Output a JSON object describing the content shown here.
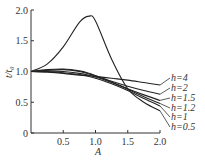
{
  "chart_data": {
    "type": "line",
    "title": "",
    "xlabel": "A",
    "ylabel": "t/t0",
    "xlim": [
      0,
      2.0
    ],
    "ylim": [
      0,
      2.0
    ],
    "xticks": [
      "0.5",
      "1.0",
      "1.5",
      "2.0"
    ],
    "yticks": [
      "0",
      "0.5",
      "1.0",
      "1.5",
      "2.0"
    ],
    "grid": false,
    "legend_position": "right, inline labels",
    "x": [
      0,
      0.25,
      0.5,
      0.75,
      0.9,
      1.0,
      1.25,
      1.5,
      1.75,
      2.0
    ],
    "series": [
      {
        "name": "h=4",
        "values": [
          1.0,
          0.99,
          0.97,
          0.94,
          0.93,
          0.92,
          0.89,
          0.86,
          0.82,
          0.78
        ]
      },
      {
        "name": "h=2",
        "values": [
          1.0,
          1.02,
          1.03,
          1.0,
          0.96,
          0.93,
          0.84,
          0.76,
          0.69,
          0.63
        ]
      },
      {
        "name": "h=1.5",
        "values": [
          1.0,
          1.03,
          1.04,
          1.01,
          0.97,
          0.93,
          0.83,
          0.72,
          0.62,
          0.53
        ]
      },
      {
        "name": "h=1.2",
        "values": [
          1.0,
          1.01,
          1.0,
          0.97,
          0.94,
          0.91,
          0.82,
          0.71,
          0.59,
          0.48
        ]
      },
      {
        "name": "h=1",
        "values": [
          1.0,
          1.0,
          0.98,
          0.95,
          0.92,
          0.89,
          0.8,
          0.69,
          0.56,
          0.44
        ]
      },
      {
        "name": "h=0.5",
        "values": [
          1.0,
          1.12,
          1.4,
          1.8,
          1.9,
          1.82,
          1.2,
          0.72,
          0.5,
          0.36
        ]
      }
    ]
  },
  "axes": {
    "xlabel": "A",
    "ylabel": "t/t₀",
    "origin": "0"
  }
}
